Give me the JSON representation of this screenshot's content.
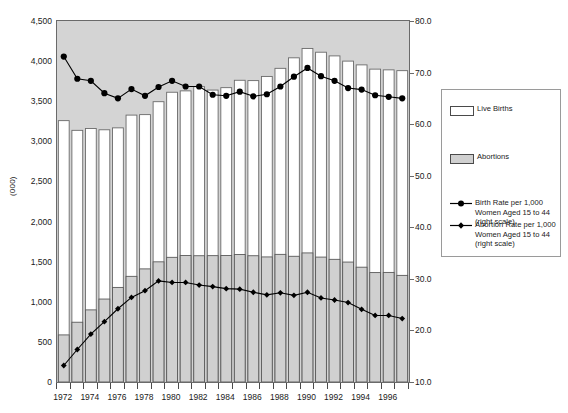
{
  "axes": {
    "y_left_label": "(000)",
    "y_left_ticks": [
      "0",
      "500",
      "1,000",
      "1,500",
      "2,000",
      "2,500",
      "3,000",
      "3,500",
      "4,000",
      "4,500"
    ],
    "y_right_ticks": [
      "10.0",
      "20.0",
      "30.0",
      "40.0",
      "50.0",
      "60.0",
      "70.0",
      "80.0"
    ],
    "x_ticks": [
      "1972",
      "1974",
      "1976",
      "1978",
      "1980",
      "1982",
      "1984",
      "1986",
      "1988",
      "1990",
      "1992",
      "1994",
      "1996"
    ]
  },
  "legend": {
    "items": [
      {
        "name": "live-births",
        "label": "Live Births",
        "marker": "swatch-white",
        "color": "#ffffff"
      },
      {
        "name": "abortions",
        "label": "Abortions",
        "marker": "swatch-gray",
        "color": "#d0d0d0"
      },
      {
        "name": "birth-rate",
        "label": "Birth Rate per 1,000\nWomen Aged 15 to 44\n(right scale)",
        "marker": "line-circle",
        "color": "#000000"
      },
      {
        "name": "abortion-rate",
        "label": "Abortion Rate per 1,000\nWomen Aged 15 to 44\n(right scale)",
        "marker": "line-diamond",
        "color": "#000000"
      }
    ]
  },
  "colors": {
    "plot_background": "#d4d4d4",
    "live_births_bar": "#ffffff",
    "abortions_bar": "#d0d0d0",
    "line": "#000000",
    "axis": "#6a6a6a"
  },
  "chart_data": {
    "type": "bar",
    "title": "",
    "subtitle": "",
    "xlabel": "",
    "ylabel": "(000)",
    "ylabel_right": "Rate per 1,000 Women Aged 15 to 44",
    "grid": false,
    "legend_position": "right",
    "ylim": [
      0,
      4500
    ],
    "ylim_right": [
      10.0,
      80.0
    ],
    "categories": [
      1972,
      1973,
      1974,
      1975,
      1976,
      1977,
      1978,
      1979,
      1980,
      1981,
      1982,
      1983,
      1984,
      1985,
      1986,
      1987,
      1988,
      1989,
      1990,
      1991,
      1992,
      1993,
      1994,
      1995,
      1996,
      1997
    ],
    "series": [
      {
        "name": "Live Births",
        "axis": "left",
        "type": "bar",
        "values": [
          3258,
          3137,
          3160,
          3144,
          3168,
          3327,
          3333,
          3494,
          3612,
          3629,
          3681,
          3639,
          3669,
          3761,
          3757,
          3809,
          3910,
          4041,
          4158,
          4111,
          4065,
          4000,
          3953,
          3900,
          3891,
          3881
        ]
      },
      {
        "name": "Abortions",
        "axis": "left",
        "type": "bar",
        "values": [
          587,
          745,
          899,
          1034,
          1179,
          1317,
          1410,
          1498,
          1554,
          1577,
          1574,
          1575,
          1577,
          1589,
          1574,
          1559,
          1591,
          1567,
          1609,
          1557,
          1529,
          1495,
          1431,
          1364,
          1366,
          1329
        ]
      },
      {
        "name": "Birth Rate per 1,000 Women Aged 15 to 44",
        "axis": "right",
        "type": "line",
        "marker": "circle",
        "values": [
          73.1,
          68.8,
          68.4,
          66.0,
          65.0,
          66.8,
          65.5,
          67.2,
          68.4,
          67.3,
          67.3,
          65.7,
          65.5,
          66.3,
          65.4,
          65.8,
          67.3,
          69.2,
          70.9,
          69.3,
          68.4,
          67.0,
          66.7,
          65.6,
          65.3,
          65.0
        ]
      },
      {
        "name": "Abortion Rate per 1,000 Women Aged 15 to 44",
        "axis": "right",
        "type": "line",
        "marker": "diamond",
        "values": [
          13.2,
          16.3,
          19.3,
          21.7,
          24.2,
          26.4,
          27.7,
          29.6,
          29.3,
          29.3,
          28.8,
          28.5,
          28.1,
          28.0,
          27.4,
          26.9,
          27.3,
          26.8,
          27.4,
          26.3,
          25.9,
          25.4,
          24.1,
          22.9,
          22.9,
          22.3
        ]
      }
    ]
  }
}
